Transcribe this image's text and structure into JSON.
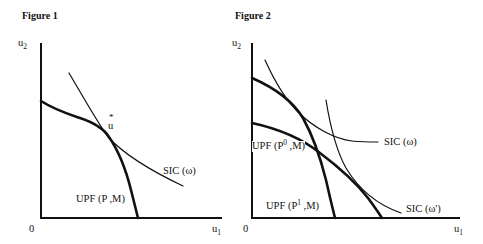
{
  "figures": [
    {
      "title": "Figure 1",
      "y_axis_label": "u",
      "y_axis_sub": "2",
      "x_axis_label": "u",
      "x_axis_sub": "1",
      "origin_label": "0",
      "point_label": {
        "main": "u",
        "star": "*"
      },
      "curves": [
        {
          "label": "UPF (P ,M)",
          "kind": "utility possibility frontier",
          "style": "thick"
        },
        {
          "label": "SIC (ω)",
          "kind": "social indifference curve",
          "style": "thin"
        }
      ]
    },
    {
      "title": "Figure 2",
      "y_axis_label": "u",
      "y_axis_sub": "2",
      "x_axis_label": "u",
      "x_axis_sub": "1",
      "origin_label": "0",
      "curves": [
        {
          "label_prefix": "UPF (P",
          "label_sup": "0",
          "label_suffix": " ,M)",
          "kind": "utility possibility frontier",
          "style": "thick"
        },
        {
          "label_prefix": "UPF (P",
          "label_sup": "1",
          "label_suffix": " ,M)",
          "kind": "utility possibility frontier",
          "style": "thick"
        },
        {
          "label": "SIC (ω)",
          "kind": "social indifference curve",
          "style": "thin"
        },
        {
          "label": "SIC (ω')",
          "kind": "social indifference curve",
          "style": "thin"
        }
      ]
    }
  ]
}
